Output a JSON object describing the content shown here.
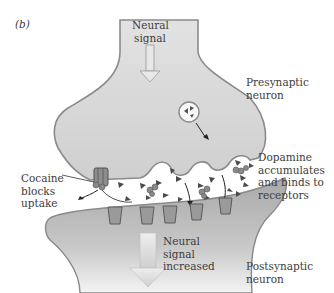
{
  "panel_label": "(b)",
  "labels": {
    "neural_signal": [
      "Neural",
      "signal"
    ],
    "presynaptic": [
      "Presynaptic",
      "neuron"
    ],
    "dopamine": [
      "Dopamine",
      "accumulates",
      "and binds to",
      "receptors"
    ],
    "cocaine": [
      "Cocaine",
      "blocks",
      "uptake"
    ],
    "neural_signal_increased": [
      "Neural",
      "signal",
      "increased"
    ],
    "postsynaptic": [
      "Postsynaptic",
      "neuron"
    ]
  },
  "colors": {
    "presynaptic_fill": "#d6d6d6",
    "postsynaptic_fill": "#b5b5b5",
    "membrane": "#8a8a8a",
    "receptor": "#9a9a9a",
    "dopamine": "#555555",
    "arrow_fill": "#e4e4e4"
  }
}
